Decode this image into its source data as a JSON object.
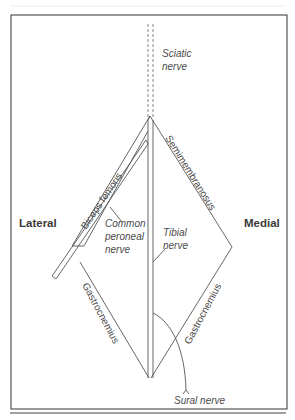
{
  "diagram": {
    "sides": {
      "lateral": "Lateral",
      "medial": "Medial"
    },
    "muscles": {
      "biceps_femoris": "Biceps femoris",
      "semimembranosus": "Semimembranosus",
      "gastrocnemius_lateral": "Gastrocnemius",
      "gastrocnemius_medial": "Gastrocnemius"
    },
    "nerves": {
      "sciatic_line1": "Sciatic",
      "sciatic_line2": "nerve",
      "common_peroneal_line1": "Common",
      "common_peroneal_line2": "peroneal",
      "common_peroneal_line3": "nerve",
      "tibial_line1": "Tibial",
      "tibial_line2": "nerve",
      "sural": "Sural nerve"
    },
    "colors": {
      "line": "#555555",
      "text": "#4a4a4a",
      "frame": "#333333",
      "background": "#ffffff"
    }
  }
}
